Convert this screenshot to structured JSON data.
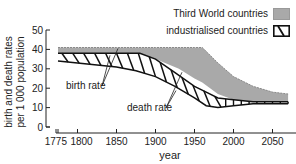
{
  "chart_data": {
    "type": "area",
    "title": "",
    "xlabel": "year",
    "ylabel": "birth and death rates per 1 000 population",
    "ylabel_lines": [
      "birth and death rates",
      "per 1 000 population"
    ],
    "xlim": [
      1775,
      2075
    ],
    "ylim": [
      0,
      50
    ],
    "xticks": [
      1775,
      1800,
      1850,
      1900,
      1950,
      2000,
      2050
    ],
    "yticks": [
      0,
      10,
      20,
      30,
      40,
      50
    ],
    "grid": false,
    "legend_position": "top-right",
    "legend": [
      {
        "label": "Third World countries",
        "style": "grey-fill"
      },
      {
        "label": "industrialised countries",
        "style": "hatched"
      }
    ],
    "annotations": [
      {
        "text": "birth rate",
        "points_to": "upper edges of both bands"
      },
      {
        "text": "death rate",
        "points_to": "lower edges of both bands"
      }
    ],
    "series": [
      {
        "name": "Third World countries",
        "birth_rate": {
          "x": [
            1775,
            1850,
            1900,
            1950,
            1960,
            1980,
            2000,
            2025,
            2050,
            2070
          ],
          "y": [
            41,
            41,
            41,
            41,
            41,
            33,
            26,
            21,
            18,
            17
          ]
        },
        "death_rate": {
          "x": [
            1775,
            1850,
            1880,
            1900,
            1930,
            1950,
            1960,
            1980,
            2000,
            2025,
            2050,
            2070
          ],
          "y": [
            38,
            38,
            38,
            35,
            30,
            25,
            23,
            17,
            14,
            13,
            13,
            13
          ]
        }
      },
      {
        "name": "industrialised countries",
        "birth_rate": {
          "x": [
            1775,
            1800,
            1850,
            1880,
            1900,
            1925,
            1950,
            1965,
            1980,
            2000,
            2025,
            2050,
            2070
          ],
          "y": [
            38,
            38,
            38,
            38,
            35,
            28,
            21,
            18,
            15,
            14,
            13,
            13,
            13
          ]
        },
        "death_rate": {
          "x": [
            1775,
            1800,
            1850,
            1875,
            1900,
            1925,
            1950,
            1965,
            1980,
            2000,
            2025,
            2050,
            2070
          ],
          "y": [
            34,
            33,
            31,
            29,
            26,
            21,
            15,
            11,
            10,
            11,
            12,
            12,
            12
          ]
        }
      }
    ]
  },
  "legend": {
    "third_world": "Third World countries",
    "industrialised": "industrialised countries"
  },
  "labels": {
    "birth_rate": "birth rate",
    "death_rate": "death rate",
    "xlabel": "year",
    "ylabel_line1": "birth and death rates",
    "ylabel_line2": "per 1 000 population"
  }
}
